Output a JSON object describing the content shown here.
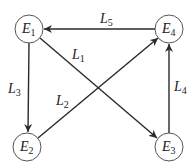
{
  "diagram": {
    "type": "directed-graph",
    "nodes": [
      {
        "id": "E1",
        "letter": "E",
        "sub": "1",
        "cx": 29,
        "cy": 29
      },
      {
        "id": "E2",
        "letter": "E",
        "sub": "2",
        "cx": 27,
        "cy": 147
      },
      {
        "id": "E3",
        "letter": "E",
        "sub": "3",
        "cx": 169,
        "cy": 147
      },
      {
        "id": "E4",
        "letter": "E",
        "sub": "4",
        "cx": 169,
        "cy": 29
      }
    ],
    "edges": [
      {
        "id": "L1",
        "letter": "L",
        "sub": "1",
        "from": "E1",
        "to": "E3"
      },
      {
        "id": "L2",
        "letter": "L",
        "sub": "2",
        "from": "E2",
        "to": "E4"
      },
      {
        "id": "L3",
        "letter": "L",
        "sub": "3",
        "from": "E1",
        "to": "E2"
      },
      {
        "id": "L4",
        "letter": "L",
        "sub": "4",
        "from": "E3",
        "to": "E4"
      },
      {
        "id": "L5",
        "letter": "L",
        "sub": "5",
        "from": "E4",
        "to": "E1"
      }
    ]
  }
}
